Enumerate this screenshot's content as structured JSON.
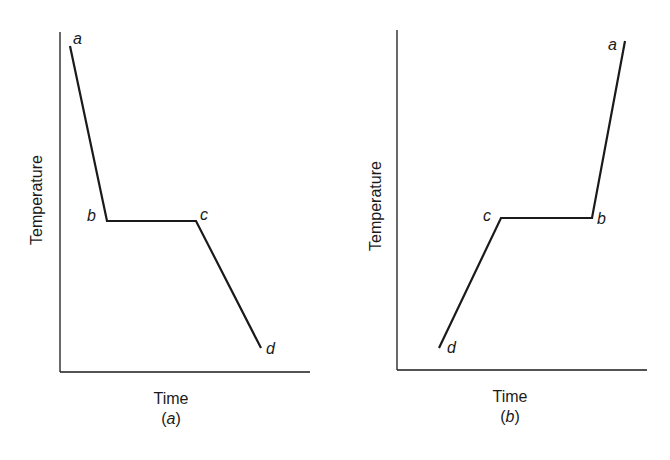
{
  "figure": {
    "panels": [
      {
        "id": "a",
        "caption": "(a)",
        "caption_letter": "a",
        "xlabel": "Time",
        "ylabel": "Temperature",
        "points": [
          {
            "label": "a",
            "x": 70,
            "y": 46
          },
          {
            "label": "b",
            "x": 107,
            "y": 221
          },
          {
            "label": "c",
            "x": 196,
            "y": 221
          },
          {
            "label": "d",
            "x": 261,
            "y": 348
          }
        ]
      },
      {
        "id": "b",
        "caption": "(b)",
        "caption_letter": "b",
        "xlabel": "Time",
        "ylabel": "Temperature",
        "points": [
          {
            "label": "d",
            "x": 439,
            "y": 348
          },
          {
            "label": "c",
            "x": 501,
            "y": 218
          },
          {
            "label": "b",
            "x": 592,
            "y": 218
          },
          {
            "label": "a",
            "x": 625,
            "y": 41
          }
        ]
      }
    ],
    "colors": {
      "line": "#1a1a1a",
      "background": "#ffffff"
    }
  }
}
